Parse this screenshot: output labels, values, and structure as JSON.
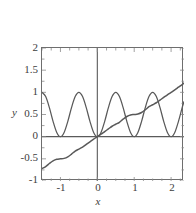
{
  "chart_data": {
    "type": "line",
    "title": "",
    "xlabel": "x",
    "ylabel": "y",
    "xlim": [
      -1.5,
      2.35
    ],
    "ylim": [
      -1,
      2
    ],
    "grid": false,
    "legend": "none",
    "xticks": [
      -1,
      0,
      1,
      2
    ],
    "xtick_labels": [
      "-1",
      "0",
      "1",
      "2"
    ],
    "yticks": [
      -1,
      -0.5,
      0,
      0.5,
      1,
      1.5,
      2
    ],
    "ytick_labels": [
      "-1",
      "-0.5",
      "0",
      "0.5",
      "1",
      "1.5",
      "2"
    ],
    "axis_lines": {
      "x_axis_at_y": 0,
      "y_axis_at_x": 0
    },
    "series": [
      {
        "name": "oscillating",
        "description": "sin squared wave, period 1, zeros at integers, peaks at 1",
        "color": "#595959",
        "x": [
          -1.5,
          -1.4,
          -1.3,
          -1.2,
          -1.1,
          -1.0,
          -0.9,
          -0.8,
          -0.7,
          -0.6,
          -0.5,
          -0.4,
          -0.3,
          -0.2,
          -0.1,
          0.0,
          0.1,
          0.2,
          0.3,
          0.4,
          0.5,
          0.6,
          0.7,
          0.8,
          0.9,
          1.0,
          1.1,
          1.2,
          1.3,
          1.4,
          1.5,
          1.6,
          1.7,
          1.8,
          1.9,
          2.0,
          2.1,
          2.2,
          2.3,
          2.35
        ],
        "values": [
          1.0,
          0.905,
          0.655,
          0.345,
          0.095,
          0.0,
          0.095,
          0.345,
          0.655,
          0.905,
          1.0,
          0.905,
          0.655,
          0.345,
          0.095,
          0.0,
          0.095,
          0.345,
          0.655,
          0.905,
          1.0,
          0.905,
          0.655,
          0.345,
          0.095,
          0.0,
          0.095,
          0.345,
          0.655,
          0.905,
          1.0,
          0.905,
          0.655,
          0.345,
          0.095,
          0.0,
          0.095,
          0.345,
          0.655,
          0.79
        ]
      },
      {
        "name": "integral-staircase",
        "description": "monotonic staircase curve, integral of the oscillating wave, passes through origin",
        "color": "#595959",
        "x": [
          -1.5,
          -1.4,
          -1.3,
          -1.2,
          -1.1,
          -1.0,
          -0.9,
          -0.8,
          -0.7,
          -0.6,
          -0.5,
          -0.4,
          -0.3,
          -0.2,
          -0.1,
          0.0,
          0.1,
          0.2,
          0.3,
          0.4,
          0.5,
          0.6,
          0.7,
          0.8,
          0.9,
          1.0,
          1.1,
          1.2,
          1.3,
          1.4,
          1.5,
          1.6,
          1.7,
          1.8,
          1.9,
          2.0,
          2.1,
          2.2,
          2.3,
          2.35
        ],
        "values": [
          -0.72,
          -0.675,
          -0.605,
          -0.545,
          -0.51,
          -0.5,
          -0.49,
          -0.455,
          -0.395,
          -0.325,
          -0.28,
          -0.235,
          -0.175,
          -0.115,
          -0.055,
          0.0,
          0.055,
          0.115,
          0.175,
          0.235,
          0.28,
          0.325,
          0.395,
          0.455,
          0.49,
          0.5,
          0.51,
          0.545,
          0.605,
          0.675,
          0.72,
          0.765,
          0.825,
          0.885,
          0.945,
          1.0,
          1.055,
          1.115,
          1.175,
          1.21
        ]
      }
    ]
  }
}
